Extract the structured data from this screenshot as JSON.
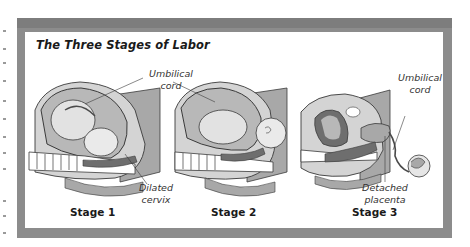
{
  "figure": {
    "title": "The Three Stages of Labor",
    "colors": {
      "frame": "#8c8c8c",
      "frame_top": "#7d7d7d",
      "panel": "#ffffff",
      "tissue_light": "#d4d4d4",
      "tissue_mid": "#a8a8a8",
      "tissue_dark": "#6e6e6e",
      "outline": "#3a3a3a"
    },
    "panels": [
      {
        "stage_label": "Stage 1",
        "annotations": [
          "Umbilical cord",
          "Dilated cervix"
        ]
      },
      {
        "stage_label": "Stage 2",
        "annotations": []
      },
      {
        "stage_label": "Stage 3",
        "annotations": [
          "Umbilical cord",
          "Detached placenta"
        ]
      }
    ],
    "labels": {
      "umbilical_1_line1": "Umbilical",
      "umbilical_1_line2": "cord",
      "dilated_line1": "Dilated",
      "dilated_line2": "cervix",
      "umbilical_3_line1": "Umbilical",
      "umbilical_3_line2": "cord",
      "detached_line1": "Detached",
      "detached_line2": "placenta",
      "stage1": "Stage 1",
      "stage2": "Stage 2",
      "stage3": "Stage 3"
    }
  }
}
